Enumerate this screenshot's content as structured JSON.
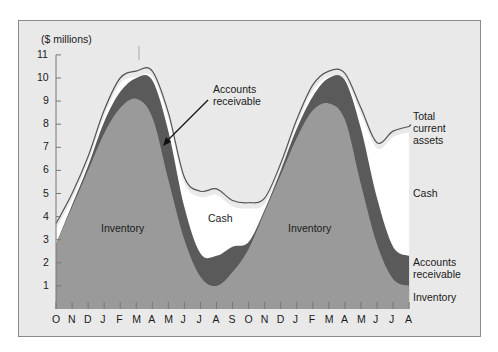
{
  "chart_data": {
    "type": "area",
    "title": "",
    "ylabel": "($ millions)",
    "xlabel": "",
    "ylim": [
      0,
      11
    ],
    "yticks": [
      1,
      2,
      3,
      4,
      5,
      6,
      7,
      8,
      9,
      10,
      11
    ],
    "categories": [
      "O",
      "N",
      "D",
      "J",
      "F",
      "M",
      "A",
      "M",
      "J",
      "J",
      "A",
      "S",
      "O",
      "N",
      "D",
      "J",
      "F",
      "M",
      "A",
      "M",
      "J",
      "J",
      "A",
      "S"
    ],
    "x_tick_labels": [
      "O",
      "N",
      "D",
      "J",
      "F",
      "M",
      "A",
      "M",
      "J",
      "J",
      "A",
      "S",
      "O",
      "N",
      "D",
      "J",
      "F",
      "M",
      "A",
      "M",
      "J",
      "J",
      "A",
      "S"
    ],
    "stacked": true,
    "series": [
      {
        "name": "Inventory",
        "color": "#9a9a9a",
        "values": [
          2.8,
          4.4,
          6.0,
          7.6,
          8.7,
          9.1,
          8.3,
          5.6,
          3.0,
          1.4,
          1.0,
          1.6,
          2.6,
          4.2,
          5.8,
          7.4,
          8.6,
          8.9,
          8.2,
          5.4,
          2.8,
          1.3,
          1.0,
          1.1
        ]
      },
      {
        "name": "Accounts receivable",
        "color": "#5a5a5a",
        "values": [
          0.0,
          0.1,
          0.2,
          0.5,
          0.7,
          0.9,
          1.6,
          2.1,
          1.4,
          1.0,
          1.3,
          1.1,
          0.3,
          0.1,
          0.2,
          0.4,
          0.6,
          1.1,
          1.7,
          2.4,
          2.0,
          1.4,
          1.3,
          1.2
        ]
      },
      {
        "name": "Cash",
        "color": "#ffffff",
        "values": [
          0.9,
          0.5,
          0.4,
          0.5,
          0.6,
          0.3,
          0.4,
          0.8,
          1.3,
          2.7,
          2.9,
          2.0,
          1.7,
          0.5,
          0.3,
          0.4,
          0.5,
          0.3,
          0.3,
          0.9,
          2.4,
          5.0,
          5.6,
          5.5
        ]
      }
    ],
    "total_current_assets": [
      3.7,
      5.0,
      6.6,
      8.6,
      10.0,
      10.3,
      10.3,
      8.5,
      5.7,
      5.1,
      5.2,
      4.7,
      4.6,
      4.8,
      6.3,
      8.2,
      9.7,
      10.3,
      10.2,
      8.7,
      7.2,
      7.7,
      7.9,
      7.8
    ],
    "annotations": [
      {
        "text": "Accounts receivable",
        "arrow_to": "first-peak AR band"
      },
      {
        "text": "Cash",
        "position": "first trough"
      },
      {
        "text": "Inventory",
        "position": "first hump"
      },
      {
        "text": "Inventory",
        "position": "second hump"
      }
    ],
    "legend": {
      "position": "right",
      "entries": [
        "Total current assets",
        "Cash",
        "Accounts receivable",
        "Inventory"
      ]
    },
    "grid": false
  },
  "labels": {
    "y_unit": "($ millions)",
    "ar_callout": [
      "Accounts",
      "receivable"
    ],
    "cash_inner": "Cash",
    "inv_left": "Inventory",
    "inv_right": "Inventory",
    "legend_total": [
      "Total",
      "current",
      "assets"
    ],
    "legend_cash": "Cash",
    "legend_ar": [
      "Accounts",
      "receivable"
    ],
    "legend_inv": "Inventory"
  }
}
